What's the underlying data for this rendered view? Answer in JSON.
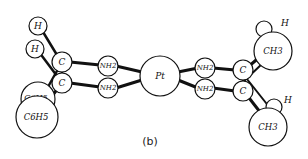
{
  "figure": {
    "caption": "(b)",
    "colors": {
      "line": "#111111",
      "fill": "#ffffff"
    }
  },
  "atoms": {
    "h_top": "H",
    "h_mid": "H",
    "c_left_upper": "C",
    "c_left_lower": "C",
    "phenyl_upper": "C6H5",
    "phenyl_lower": "C6H5",
    "nh2_left_upper": "NH2",
    "nh2_left_lower": "NH2",
    "pt": "Pt",
    "nh2_right_upper": "NH2",
    "nh2_right_lower": "NH2",
    "c_right_upper": "C",
    "c_right_lower": "C",
    "ch3_upper": "CH3",
    "ch3_lower": "CH3",
    "h_right_upper": "H",
    "h_right_lower": "H"
  }
}
